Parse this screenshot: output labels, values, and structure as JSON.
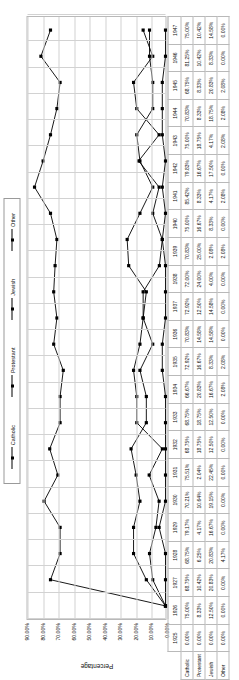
{
  "chart_data": {
    "type": "line",
    "title": "",
    "xlabel": "",
    "ylabel": "Percentage",
    "ylim": [
      0,
      0.9
    ],
    "grid": true,
    "legend_position": "top",
    "ytick_labels": [
      "90.00%",
      "80.00%",
      "70.00%",
      "60.00%",
      "50.00%",
      "40.00%",
      "30.00%",
      "20.00%",
      "10.00%",
      "0.00%"
    ],
    "ytick_values": [
      0.9,
      0.8,
      0.7,
      0.6,
      0.5,
      0.4,
      0.3,
      0.2,
      0.1,
      0.0
    ],
    "categories": [
      "1925",
      "1926",
      "1927",
      "1928",
      "1929",
      "1930",
      "1931",
      "1932",
      "1933",
      "1934",
      "1935",
      "1936",
      "1937",
      "1938",
      "1939",
      "1940",
      "1941",
      "1942",
      "1943",
      "1944",
      "1945",
      "1946",
      "1947"
    ],
    "series": [
      {
        "name": "Catholic",
        "labels": [
          "0.00%",
          "75.00%",
          "68.75%",
          "68.75%",
          "79.17%",
          "70.21%",
          "75.51%",
          "68.75%",
          "68.75%",
          "66.67%",
          "72.92%",
          "70.83%",
          "72.92%",
          "72.00%",
          "70.83%",
          "75.00%",
          "85.42%",
          "79.83%",
          "75.00%",
          "70.83%",
          "68.75%",
          "81.25%",
          "75.00%"
        ],
        "values": [
          0.0,
          0.75,
          0.6875,
          0.6875,
          0.7917,
          0.7021,
          0.7551,
          0.6875,
          0.6875,
          0.6667,
          0.7292,
          0.7083,
          0.7292,
          0.72,
          0.7083,
          0.75,
          0.8542,
          0.7983,
          0.75,
          0.7083,
          0.6875,
          0.8125,
          0.75
        ]
      },
      {
        "name": "Protestant",
        "labels": [
          "0.00%",
          "8.33%",
          "10.42%",
          "6.25%",
          "4.17%",
          "10.64%",
          "2.04%",
          "18.75%",
          "18.75%",
          "20.83%",
          "16.67%",
          "14.58%",
          "12.50%",
          "24.00%",
          "25.00%",
          "16.67%",
          "8.33%",
          "16.67%",
          "18.75%",
          "8.33%",
          "8.33%",
          "10.42%",
          "10.42%"
        ],
        "values": [
          0.0,
          0.0833,
          0.1042,
          0.0625,
          0.0417,
          0.1064,
          0.0204,
          0.1875,
          0.1875,
          0.2083,
          0.1667,
          0.1458,
          0.125,
          0.24,
          0.25,
          0.1667,
          0.0833,
          0.1667,
          0.1875,
          0.0833,
          0.0833,
          0.1042,
          0.1042
        ]
      },
      {
        "name": "Jewish",
        "labels": [
          "0.00%",
          "12.50%",
          "20.83%",
          "20.83%",
          "16.67%",
          "19.15%",
          "22.45%",
          "12.50%",
          "12.50%",
          "16.67%",
          "8.33%",
          "14.58%",
          "14.58%",
          "4.00%",
          "2.08%",
          "8.33%",
          "4.17%",
          "17.50%",
          "4.17%",
          "18.75%",
          "20.83%",
          "8.33%",
          "14.58%"
        ],
        "values": [
          0.0,
          0.125,
          0.2083,
          0.2083,
          0.1667,
          0.1915,
          0.2245,
          0.125,
          0.125,
          0.1667,
          0.0833,
          0.1458,
          0.1458,
          0.04,
          0.0208,
          0.0833,
          0.0417,
          0.175,
          0.0417,
          0.1875,
          0.2083,
          0.0833,
          0.1458
        ]
      },
      {
        "name": "Other",
        "labels": [
          "0.00%",
          "0.00%",
          "0.00%",
          "4.17%",
          "0.00%",
          "0.00%",
          "0.00%",
          "0.00%",
          "0.00%",
          "2.08%",
          "2.08%",
          "0.00%",
          "0.00%",
          "0.00%",
          "2.08%",
          "0.00%",
          "2.08%",
          "0.00%",
          "2.08%",
          "2.08%",
          "2.08%",
          "0.00%",
          "0.00%"
        ],
        "values": [
          0.0,
          0.0,
          0.0,
          0.0417,
          0.0,
          0.0,
          0.0,
          0.0,
          0.0,
          0.0208,
          0.0208,
          0.0,
          0.0,
          0.0,
          0.0208,
          0.0,
          0.0208,
          0.0,
          0.0208,
          0.0208,
          0.0208,
          0.0,
          0.0
        ]
      }
    ]
  },
  "legend": {
    "items": [
      {
        "label": "Catholic"
      },
      {
        "label": "Protestant"
      },
      {
        "label": "Jewish"
      },
      {
        "label": "Other"
      }
    ]
  },
  "colors": {
    "series_line": "#000000",
    "gridline": "#d2d2d2",
    "border": "#b9b9b9",
    "text": "#111111"
  }
}
